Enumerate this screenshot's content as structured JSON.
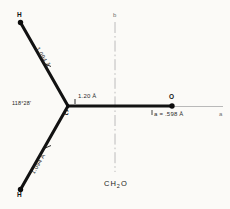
{
  "figure": {
    "caption": "CH2O",
    "caption_formula_base": "CH",
    "caption_formula_sub": "2",
    "caption_formula_tail": "O",
    "background_color": "#fbfaf7",
    "bond_color": "#121212",
    "axis_color": "#9a9a9a"
  },
  "atoms": [
    {
      "id": "h-top",
      "label": "H",
      "x": 20,
      "y": 22
    },
    {
      "id": "carbon",
      "label": "C",
      "x": 68,
      "y": 106
    },
    {
      "id": "oxygen",
      "label": "O",
      "x": 172,
      "y": 106
    },
    {
      "id": "h-bottom",
      "label": "H",
      "x": 20,
      "y": 190
    }
  ],
  "bonds": [
    {
      "id": "c-h-top",
      "label": "1.094 Å",
      "from": "carbon",
      "to": "h-top"
    },
    {
      "id": "c-o",
      "label": "1.20 Å",
      "from": "carbon",
      "to": "oxygen"
    },
    {
      "id": "c-h-bottom",
      "label": "1.094 Å",
      "from": "carbon",
      "to": "h-bottom"
    }
  ],
  "angles": [
    {
      "id": "hch-angle",
      "label": "118°28'",
      "vertex": "carbon"
    }
  ],
  "axes": [
    {
      "id": "axis-a",
      "label": "a",
      "orientation": "horizontal"
    },
    {
      "id": "axis-b",
      "label": "b",
      "orientation": "vertical"
    }
  ],
  "annotations": [
    {
      "id": "a-offset",
      "label": "a = .598 Å"
    }
  ]
}
